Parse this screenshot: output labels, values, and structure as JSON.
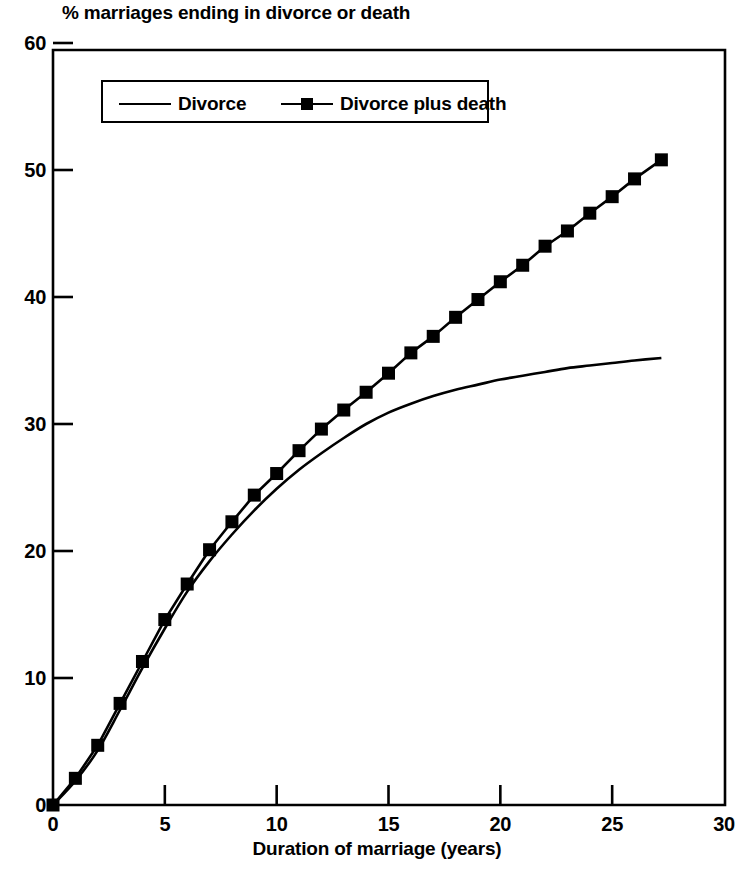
{
  "chart_data": {
    "type": "line",
    "title": "% marriages ending in divorce or death",
    "xlabel": "Duration of marriage (years)",
    "ylabel": "",
    "xlim": [
      0,
      30
    ],
    "ylim": [
      0,
      60
    ],
    "xticks": [
      0,
      5,
      10,
      15,
      20,
      25,
      30
    ],
    "yticks": [
      0,
      10,
      20,
      30,
      40,
      50,
      60
    ],
    "xtick_labels": [
      "0",
      "5",
      "10",
      "15",
      "20",
      "25",
      "30"
    ],
    "ytick_labels": [
      "0",
      "10",
      "20",
      "30",
      "40",
      "50",
      "60"
    ],
    "grid": false,
    "legend_position": "top-left-inside",
    "series": [
      {
        "name": "Divorce",
        "marker": "none",
        "color": "#000000",
        "x": [
          0,
          1,
          2,
          3,
          4,
          5,
          6,
          7,
          8,
          9,
          10,
          11,
          12,
          13,
          14,
          15,
          16,
          17,
          18,
          19,
          20,
          21,
          22,
          23,
          24,
          25,
          26,
          27.2
        ],
        "values": [
          0,
          1.9,
          4.3,
          7.5,
          10.8,
          13.9,
          16.8,
          19.2,
          21.3,
          23.2,
          24.9,
          26.4,
          27.7,
          28.9,
          30.0,
          30.9,
          31.6,
          32.2,
          32.7,
          33.1,
          33.5,
          33.8,
          34.1,
          34.4,
          34.6,
          34.8,
          35.0,
          35.2
        ]
      },
      {
        "name": "Divorce plus death",
        "marker": "square",
        "color": "#000000",
        "x": [
          0,
          1,
          2,
          3,
          4,
          5,
          6,
          7,
          8,
          9,
          10,
          11,
          12,
          13,
          14,
          15,
          16,
          17,
          18,
          19,
          20,
          21,
          22,
          23,
          24,
          25,
          26,
          27.2
        ],
        "values": [
          0,
          2.1,
          4.7,
          8.0,
          11.3,
          14.6,
          17.4,
          20.1,
          22.3,
          24.4,
          26.1,
          27.9,
          29.6,
          31.1,
          32.5,
          34.0,
          35.6,
          36.9,
          38.4,
          39.8,
          41.2,
          42.5,
          44.0,
          45.2,
          46.6,
          47.9,
          49.3,
          50.8
        ]
      }
    ]
  },
  "legend": {
    "items": [
      {
        "label": "Divorce"
      },
      {
        "label": "Divorce plus death"
      }
    ]
  }
}
